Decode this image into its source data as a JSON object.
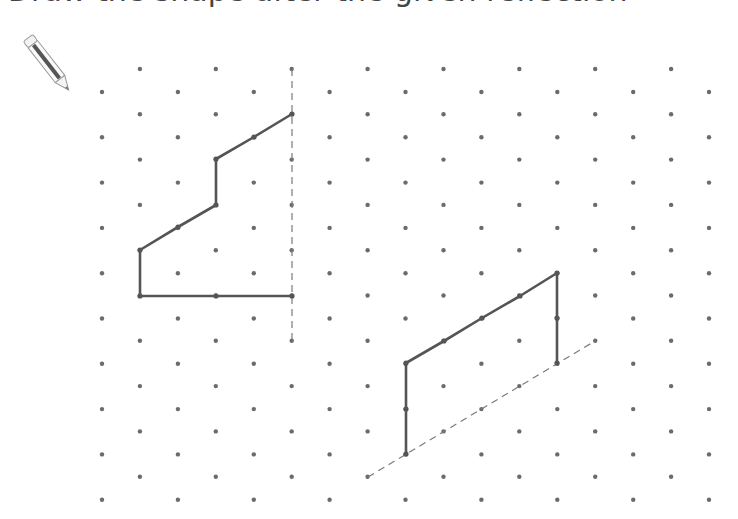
{
  "header": {
    "title_fragment": "Draw the shape after the given reflection"
  },
  "toolbar": {
    "pencil_icon": "pencil-icon"
  },
  "colors": {
    "dot": "#6b6b6b",
    "shape_stroke": "#555555",
    "mirror_dash": "#7a7a7a",
    "background": "#ffffff"
  },
  "grid": {
    "type": "isometric-dot",
    "x0": 102,
    "dx": 37.94,
    "columns": 17,
    "even_col_y0": 92,
    "odd_col_y0": 69,
    "dy": 45.3,
    "rows_per_col": 10
  },
  "shapes": [
    {
      "name": "left-shape",
      "points": [
        [
          292,
          114
        ],
        [
          254,
          137
        ],
        [
          216,
          159
        ],
        [
          216,
          205
        ],
        [
          178,
          227
        ],
        [
          140,
          250
        ],
        [
          140,
          296
        ],
        [
          216,
          296
        ],
        [
          292,
          296
        ]
      ],
      "vertex_dots": [
        [
          292,
          114
        ],
        [
          254,
          137
        ],
        [
          216,
          159
        ],
        [
          216,
          205
        ],
        [
          178,
          227
        ],
        [
          140,
          250
        ],
        [
          140,
          296
        ],
        [
          216,
          296
        ],
        [
          292,
          296
        ]
      ]
    },
    {
      "name": "right-shape",
      "points": [
        [
          406,
          454
        ],
        [
          406,
          409
        ],
        [
          406,
          363
        ],
        [
          444,
          341
        ],
        [
          482,
          318
        ],
        [
          520,
          296
        ],
        [
          557,
          273
        ],
        [
          557,
          318
        ],
        [
          557,
          363
        ]
      ],
      "vertex_dots": [
        [
          406,
          454
        ],
        [
          406,
          409
        ],
        [
          406,
          363
        ],
        [
          444,
          341
        ],
        [
          482,
          318
        ],
        [
          520,
          296
        ],
        [
          557,
          273
        ],
        [
          557,
          318
        ],
        [
          557,
          363
        ]
      ]
    }
  ],
  "mirror_lines": [
    {
      "name": "vertical-mirror-line",
      "from": [
        292,
        69
      ],
      "to": [
        292,
        341
      ]
    },
    {
      "name": "diagonal-mirror-line",
      "from": [
        368,
        477
      ],
      "to": [
        595,
        341
      ]
    }
  ]
}
